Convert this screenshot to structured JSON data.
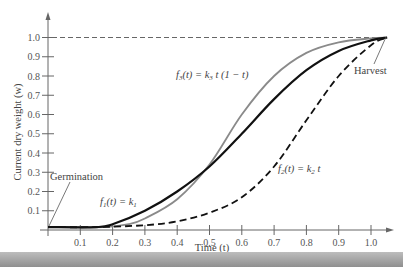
{
  "chart_data": {
    "type": "line",
    "title": "",
    "xlabel": "Time (t)",
    "ylabel": "Current dry weight (w)",
    "xlim": [
      0,
      1.1
    ],
    "ylim": [
      0,
      1.05
    ],
    "grid": false,
    "legend": "none (inline curve labels)",
    "x_ticks": [
      "0.1",
      "0.2",
      "0.3",
      "0.4",
      "0.5",
      "0.6",
      "0.7",
      "0.8",
      "0.9",
      "1.0"
    ],
    "y_ticks": [
      "0.1",
      "0.2",
      "0.3",
      "0.4",
      "0.5",
      "0.6",
      "0.7",
      "0.8",
      "0.9",
      "1.0"
    ],
    "reference_line": {
      "y": 1.0,
      "style": "dashed",
      "label": "max weight"
    },
    "series": [
      {
        "name": "f1(t) = k1",
        "style": "solid black (thick)",
        "color": "#111111",
        "x": [
          0,
          0.15,
          0.2,
          0.3,
          0.4,
          0.5,
          0.6,
          0.7,
          0.8,
          0.9,
          1.0,
          1.05
        ],
        "y": [
          0.015,
          0.015,
          0.03,
          0.1,
          0.2,
          0.33,
          0.5,
          0.68,
          0.83,
          0.93,
          0.985,
          1.0
        ]
      },
      {
        "name": "f2(t) = k2 t",
        "style": "dashed black",
        "color": "#111111",
        "x": [
          0,
          0.15,
          0.3,
          0.4,
          0.5,
          0.6,
          0.7,
          0.8,
          0.9,
          1.0,
          1.05
        ],
        "y": [
          0.015,
          0.015,
          0.025,
          0.045,
          0.09,
          0.17,
          0.33,
          0.57,
          0.8,
          0.96,
          1.0
        ]
      },
      {
        "name": "f3(t) = k3 t (1 - t)",
        "style": "solid gray",
        "color": "#8a8a8a",
        "x": [
          0,
          0.17,
          0.25,
          0.3,
          0.4,
          0.5,
          0.6,
          0.7,
          0.8,
          0.9,
          1.0,
          1.05
        ],
        "y": [
          0.015,
          0.015,
          0.03,
          0.06,
          0.16,
          0.34,
          0.6,
          0.8,
          0.92,
          0.975,
          0.995,
          1.0
        ]
      }
    ],
    "annotations": [
      {
        "text": "Germination",
        "points_to": [
          0,
          0.015
        ]
      },
      {
        "text": "Harvest",
        "points_to": [
          1.05,
          1.0
        ]
      },
      {
        "text": "f1(t) = k1",
        "near": [
          0.28,
          0.16
        ]
      },
      {
        "text": "f2(t) = k2 t",
        "near": [
          0.86,
          0.32
        ]
      },
      {
        "text": "f3(t) = k3 t (1 − t)",
        "near": [
          0.42,
          0.82
        ]
      }
    ]
  },
  "labels": {
    "xlabel": "Time (t)",
    "ylabel": "Current dry weight (w)",
    "germination": "Germination",
    "harvest": "Harvest",
    "f1": {
      "pre": "f",
      "sub": "1",
      "mid": "(t) = k",
      "sub2": "1",
      "post": ""
    },
    "f2": {
      "pre": "f",
      "sub": "2",
      "mid": "(t) = k",
      "sub2": "2",
      "post": " t"
    },
    "f3": {
      "pre": "f",
      "sub": "3",
      "mid": "(t) = k",
      "sub2": "3",
      "post": " t (1 − t)"
    }
  }
}
